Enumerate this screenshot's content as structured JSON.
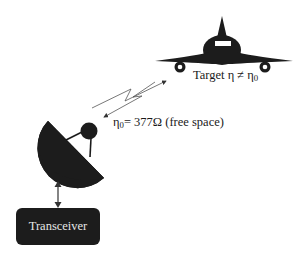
{
  "diagram": {
    "target": {
      "label_prefix": "Target η ≠ η",
      "label_sub": "0"
    },
    "free_space": {
      "label_prefix": "η",
      "label_sub": "0",
      "label_suffix": "= 377Ω (free space)"
    },
    "transceiver": {
      "label": "Transceiver"
    },
    "icons": [
      "aircraft-icon",
      "radar-dish-icon",
      "signal-wave-icon",
      "bidirectional-arrow-icon"
    ],
    "colors": {
      "ink": "#1c1c1c",
      "line": "#555555",
      "background": "#ffffff"
    }
  }
}
